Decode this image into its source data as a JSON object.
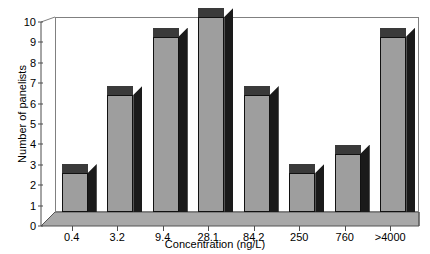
{
  "chart_data": {
    "type": "bar",
    "title": "",
    "subtitle": "",
    "xlabel": "Concentration (ng/L)",
    "ylabel": "Number of panelists",
    "categories": [
      "0.4",
      "3.2",
      "9.4",
      "28.1",
      "84.2",
      "250",
      "760",
      ">4000"
    ],
    "values": [
      2,
      6,
      9,
      10,
      6,
      2,
      3,
      9
    ],
    "ylim": [
      0,
      10
    ],
    "yticks": [
      0,
      1,
      2,
      3,
      4,
      5,
      6,
      7,
      8,
      9,
      10
    ],
    "ytick_labels": [
      "0",
      "1",
      "2",
      "3",
      "4",
      "5",
      "6",
      "7",
      "8",
      "9",
      "10"
    ],
    "grid": false,
    "legend": null,
    "legend_position": "none",
    "style": "3d-column",
    "colors": {
      "bar_front": "#9e9e9e",
      "bar_side": "#1a1a1a",
      "bar_top": "#3a3a3a",
      "floor": "#a8a8a8",
      "axis": "#4d4d4d",
      "plot_border": "#808080",
      "background": "#ffffff",
      "text": "#000000"
    }
  },
  "axes": {
    "y_title": "Number of panelists",
    "x_title": "Concentration (ng/L)"
  }
}
